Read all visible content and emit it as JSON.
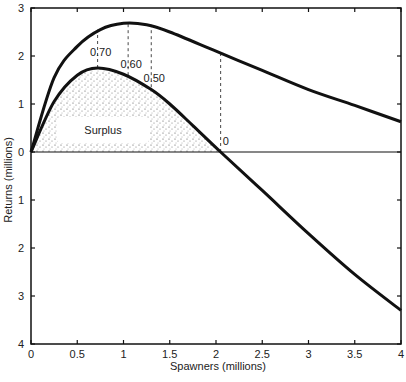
{
  "chart_data": {
    "type": "line",
    "title": "",
    "xlabel": "Spawners (millions)",
    "ylabel": "Returns (millions)",
    "xlim": [
      0,
      4
    ],
    "ylim": [
      -4,
      3
    ],
    "x_ticks": [
      "0",
      "0.5",
      "1",
      "1.5",
      "2",
      "2.5",
      "3",
      "3.5",
      "4"
    ],
    "y_ticks_upper": [
      "3",
      "2",
      "1",
      "0"
    ],
    "y_ticks_lower": [
      "1",
      "2",
      "3",
      "4"
    ],
    "grid": false,
    "legend": null,
    "series": [
      {
        "name": "Returns curve",
        "x": [
          0,
          0.25,
          0.5,
          0.75,
          1.0,
          1.25,
          1.5,
          2.0,
          2.5,
          3.0,
          3.5,
          4.0
        ],
        "values": [
          0,
          1.55,
          2.2,
          2.55,
          2.68,
          2.65,
          2.5,
          2.1,
          1.7,
          1.3,
          0.97,
          0.63
        ]
      },
      {
        "name": "Surplus curve",
        "x": [
          0,
          0.25,
          0.5,
          0.72,
          1.0,
          1.3,
          1.5,
          1.75,
          2.05,
          2.5,
          3.0,
          3.5,
          4.0
        ],
        "values": [
          0,
          1.05,
          1.6,
          1.75,
          1.62,
          1.3,
          1.0,
          0.55,
          0,
          -0.8,
          -1.7,
          -2.55,
          -3.3
        ]
      }
    ],
    "annotations": [
      {
        "text": "0.70",
        "x": 0.72,
        "y_label": 1.95,
        "dashed_from": 1.75,
        "dashed_to": 2.55
      },
      {
        "text": "0.60",
        "x": 1.05,
        "y_label": 1.7,
        "dashed_from": 1.6,
        "dashed_to": 2.68
      },
      {
        "text": "0.50",
        "x": 1.3,
        "y_label": 1.42,
        "dashed_from": 1.35,
        "dashed_to": 2.65
      },
      {
        "text": "0",
        "x": 2.05,
        "y_label": 0.15,
        "dashed_from": 0,
        "dashed_to": 2.1
      },
      {
        "text": "Surplus",
        "x": 0.62,
        "y": 0.45,
        "region": "shaded area between lower curve and zero line"
      }
    ]
  }
}
